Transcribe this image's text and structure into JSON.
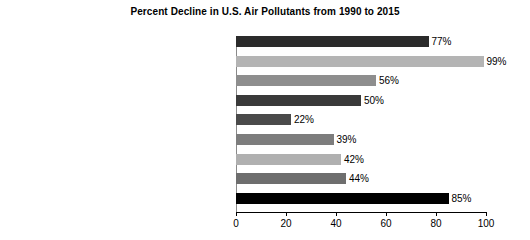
{
  "chart_data": {
    "type": "bar",
    "orientation": "horizontal",
    "title": "Percent Decline in U.S. Air Pollutants from 1990 to 2015",
    "xlabel": "",
    "ylabel": "",
    "xlim": [
      0,
      100
    ],
    "xticks": [
      "0",
      "20",
      "40",
      "60",
      "80",
      "100"
    ],
    "grid": false,
    "legend": false,
    "categories": [
      "Carbon monoxide (CO) 8-hour",
      "Lead (Pb) 3-month average",
      "Nitrogen dioxide (NO2) annual",
      "Nitrogen dioxide (NO2) 1-hour",
      "Ozone (O3) 8-hour",
      "Particulate matter 10 microns (PM10) 24-hour",
      "Particulate matter 2.5 microns (PM2.5) annual",
      "Particulate matter 2.5 microns (PM2.5) 24-hour",
      "Sulfur dioxide (SO2) 1-hour"
    ],
    "values": [
      77,
      99,
      56,
      50,
      22,
      39,
      42,
      44,
      85
    ],
    "value_labels": [
      "77%",
      "99%",
      "56%",
      "50%",
      "22%",
      "39%",
      "42%",
      "44%",
      "85%"
    ],
    "bar_colors": [
      "#2b2b2b",
      "#b4b4b4",
      "#8e8e8e",
      "#3a3a3a",
      "#4a4a4a",
      "#7d7d7d",
      "#b0b0b0",
      "#6e6e6e",
      "#000000"
    ]
  },
  "bars": [
    {
      "label_html": "Carbon monoxide (CO) 8-hour",
      "value": 77,
      "value_label": "77%",
      "color": "#2b2b2b"
    },
    {
      "label_html": "Lead (Pb) 3-month average",
      "value": 99,
      "value_label": "99%",
      "color": "#b4b4b4"
    },
    {
      "label_html": "Nitrogen dioxide (NO<sub>2</sub>) annual",
      "value": 56,
      "value_label": "56%",
      "color": "#8e8e8e"
    },
    {
      "label_html": "Nitrogen dioxide (NO<sub>2</sub>) 1-hour",
      "value": 50,
      "value_label": "50%",
      "color": "#3a3a3a"
    },
    {
      "label_html": "Ozone (O<sub>3</sub>) 8-hour",
      "value": 22,
      "value_label": "22%",
      "color": "#4a4a4a"
    },
    {
      "label_html": "Particulate matter 10 microns (PM<sub>10</sub>) 24-hour",
      "value": 39,
      "value_label": "39%",
      "color": "#7d7d7d"
    },
    {
      "label_html": "Particulate matter 2.5 microns (PM<sub>2.5</sub>) annual",
      "value": 42,
      "value_label": "42%",
      "color": "#b0b0b0"
    },
    {
      "label_html": "Particulate matter 2.5 microns (PM<sub>2.5</sub>) 24-hour",
      "value": 44,
      "value_label": "44%",
      "color": "#6e6e6e"
    },
    {
      "label_html": "Sulfur dioxide (SO<sub>2</sub>) 1-hour",
      "value": 85,
      "value_label": "85%",
      "color": "#000000"
    }
  ],
  "axis": {
    "ticks": [
      {
        "value": 0,
        "label": "0"
      },
      {
        "value": 20,
        "label": "20"
      },
      {
        "value": 40,
        "label": "40"
      },
      {
        "value": 60,
        "label": "60"
      },
      {
        "value": 80,
        "label": "80"
      },
      {
        "value": 100,
        "label": "100"
      }
    ]
  }
}
